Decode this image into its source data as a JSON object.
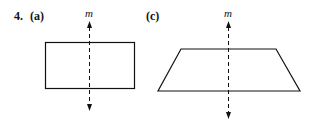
{
  "problem": {
    "number": "4.",
    "parts": [
      {
        "label": "(a)",
        "shape": "rectangle",
        "axis_label": "m"
      },
      {
        "label": "(c)",
        "shape": "trapezoid",
        "axis_label": "m"
      }
    ]
  },
  "colors": {
    "stroke": "#111111",
    "background": "#ffffff"
  }
}
